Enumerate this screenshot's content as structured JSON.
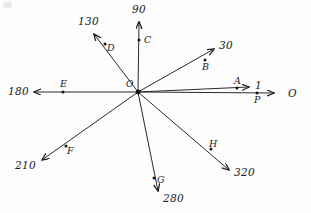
{
  "diagram": {
    "background_color": "#fdfdfd",
    "ink_color": "#1f1f1f",
    "origin": {
      "label": "O",
      "x": 138,
      "y": 92
    },
    "rays": [
      {
        "id": "ray-0",
        "bearing_label": "O",
        "bearing_degrees": 0,
        "direction": "right",
        "point_label": "P",
        "point": {
          "x": 257,
          "y": 93
        },
        "arrow_tip": {
          "x": 276,
          "y": 93
        },
        "label_pos": {
          "x": 288,
          "y": 88
        }
      },
      {
        "id": "ray-1",
        "bearing_label": "1",
        "bearing_degrees": 1,
        "direction": "right-upper",
        "point_label": "A",
        "point": {
          "x": 237,
          "y": 88
        },
        "arrow_tip": {
          "x": 251,
          "y": 87
        },
        "label_pos": {
          "x": 255,
          "y": 81
        }
      },
      {
        "id": "ray-30",
        "bearing_label": "30",
        "bearing_degrees": 30,
        "direction": "upper-right",
        "point_label": "B",
        "point": {
          "x": 205,
          "y": 60
        },
        "arrow_tip": {
          "x": 216,
          "y": 47
        },
        "label_pos": {
          "x": 219,
          "y": 42
        }
      },
      {
        "id": "ray-90",
        "bearing_label": "90",
        "bearing_degrees": 90,
        "direction": "up",
        "point_label": "C",
        "point": {
          "x": 139,
          "y": 40
        },
        "arrow_tip": {
          "x": 139,
          "y": 20
        },
        "label_pos": {
          "x": 133,
          "y": 5
        }
      },
      {
        "id": "ray-130",
        "bearing_label": "130",
        "bearing_degrees": 130,
        "direction": "upper-left",
        "point_label": "D",
        "point": {
          "x": 105,
          "y": 44
        },
        "arrow_tip": {
          "x": 92,
          "y": 32
        },
        "label_pos": {
          "x": 80,
          "y": 18
        }
      },
      {
        "id": "ray-180",
        "bearing_label": "180",
        "bearing_degrees": 180,
        "direction": "left",
        "point_label": "E",
        "point": {
          "x": 63,
          "y": 92
        },
        "arrow_tip": {
          "x": 32,
          "y": 92
        },
        "label_pos": {
          "x": 10,
          "y": 87
        }
      },
      {
        "id": "ray-210",
        "bearing_label": "210",
        "bearing_degrees": 210,
        "direction": "lower-left",
        "point_label": "F",
        "point": {
          "x": 66,
          "y": 146
        },
        "arrow_tip": {
          "x": 40,
          "y": 162
        },
        "label_pos": {
          "x": 17,
          "y": 163
        }
      },
      {
        "id": "ray-280",
        "bearing_label": "280",
        "bearing_degrees": 280,
        "direction": "down",
        "point_label": "G",
        "point": {
          "x": 154,
          "y": 178
        },
        "arrow_tip": {
          "x": 159,
          "y": 193
        },
        "label_pos": {
          "x": 162,
          "y": 196
        }
      },
      {
        "id": "ray-320",
        "bearing_label": "320",
        "bearing_degrees": 320,
        "direction": "lower-right",
        "point_label": "H",
        "point": {
          "x": 211,
          "y": 149
        },
        "arrow_tip": {
          "x": 231,
          "y": 172
        },
        "label_pos": {
          "x": 235,
          "y": 169
        }
      }
    ]
  }
}
